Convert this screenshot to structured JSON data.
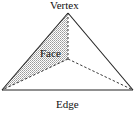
{
  "diagram": {
    "type": "tetrahedron",
    "labels": {
      "vertex": "Vertex",
      "face": "Face",
      "edge": "Edge"
    },
    "colors": {
      "stroke": "#222222",
      "face_fill": "#c8c8c8",
      "background": "#ffffff"
    },
    "points": {
      "apex": [
        68,
        13
      ],
      "base_left": [
        2,
        90
      ],
      "base_right": [
        133,
        90
      ],
      "hidden": [
        68,
        59
      ]
    }
  }
}
